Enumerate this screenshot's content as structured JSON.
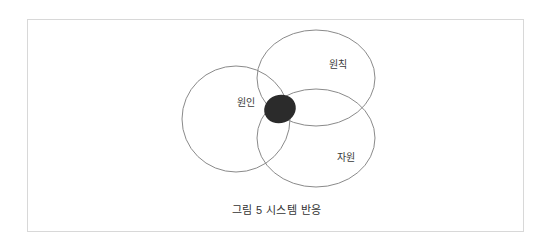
{
  "figure": {
    "caption": "그림 5 시스템 반응",
    "frame_border_color": "#d8d8d8",
    "background_color": "#ffffff"
  },
  "diagram": {
    "type": "venn",
    "outline_color": "#8a8a8a",
    "core_fill_color": "#2b2b2b",
    "label_color": "#3a3a3a",
    "sets": [
      {
        "id": "cause",
        "label": "원인",
        "position": "left",
        "center_x": 208,
        "center_y": 99,
        "radius_x": 54,
        "radius_y": 53
      },
      {
        "id": "principle",
        "label": "원칙",
        "position": "top-right",
        "center_x": 288,
        "center_y": 58,
        "radius_x": 59,
        "radius_y": 48
      },
      {
        "id": "resource",
        "label": "자원",
        "position": "bottom-right",
        "center_x": 288,
        "center_y": 118,
        "radius_x": 59,
        "radius_y": 49
      }
    ],
    "core": {
      "id": "triple-intersection",
      "label": "",
      "center_x": 252,
      "center_y": 89,
      "radius_x": 16,
      "radius_y": 14,
      "rotation": -20
    }
  }
}
